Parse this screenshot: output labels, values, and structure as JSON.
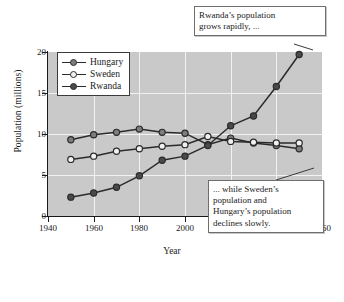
{
  "chart_data": {
    "type": "line",
    "title": "",
    "xlabel": "Year",
    "ylabel": "Population (millions)",
    "xlim": [
      1940,
      2060
    ],
    "ylim": [
      0,
      20
    ],
    "xticks": [
      1940,
      1960,
      1980,
      2000,
      2020,
      2040,
      2060
    ],
    "yticks": [
      0,
      5,
      10,
      15,
      20
    ],
    "grid": true,
    "legend_position": "top-left",
    "x": [
      1950,
      1960,
      1970,
      1980,
      1990,
      2000,
      2010,
      2020,
      2030,
      2040,
      2050
    ],
    "series": [
      {
        "name": "Hungary",
        "marker": "filled-gray",
        "color": "#7d7d7d",
        "values": [
          9.3,
          9.9,
          10.2,
          10.6,
          10.2,
          10.1,
          8.7,
          9.5,
          8.9,
          8.6,
          8.2
        ]
      },
      {
        "name": "Sweden",
        "marker": "open-white",
        "color": "#f0f0f0",
        "values": [
          6.9,
          7.3,
          7.9,
          8.2,
          8.5,
          8.7,
          9.7,
          9.1,
          9.0,
          8.9,
          8.9
        ]
      },
      {
        "name": "Rwanda",
        "marker": "filled-dark",
        "color": "#4a4a4a",
        "values": [
          2.3,
          2.8,
          3.5,
          4.9,
          6.8,
          7.3,
          8.6,
          11.0,
          12.2,
          15.8,
          19.7
        ]
      }
    ],
    "annotations": [
      {
        "id": "callout-rwanda",
        "lines": [
          "Rwanda’s population",
          "grows rapidly, ..."
        ],
        "points_to": [
          2050,
          19.7
        ]
      },
      {
        "id": "callout-decline",
        "lines": [
          "... while Sweden’s",
          "population and",
          "Hungary’s population",
          "declines slowly."
        ],
        "points_to": [
          2050,
          8.2
        ]
      }
    ]
  },
  "legend": {
    "items": [
      {
        "label": "Hungary"
      },
      {
        "label": "Sweden"
      },
      {
        "label": "Rwanda"
      }
    ]
  },
  "axes": {
    "y_title": "Population (millions)",
    "x_title": "Year",
    "y_tick_labels": [
      "0",
      "5",
      "10",
      "15",
      "20"
    ],
    "x_tick_labels": [
      "1940",
      "1960",
      "1980",
      "2000",
      "2020",
      "2040",
      "2060"
    ]
  },
  "callouts": {
    "rwanda": {
      "line1": "Rwanda’s population",
      "line2": "grows rapidly, ..."
    },
    "decline": {
      "line1": "... while Sweden’s",
      "line2": "population and",
      "line3": "Hungary’s population",
      "line4": "declines slowly."
    }
  },
  "caption": {
    "text": ""
  },
  "colors": {
    "plot_background": "#c9c9c9",
    "gridline": "#f2f2f2",
    "line": "#2b2b2b",
    "hungary_marker": "#7d7d7d",
    "sweden_marker": "#f0f0f0",
    "rwanda_marker": "#4a4a4a"
  }
}
